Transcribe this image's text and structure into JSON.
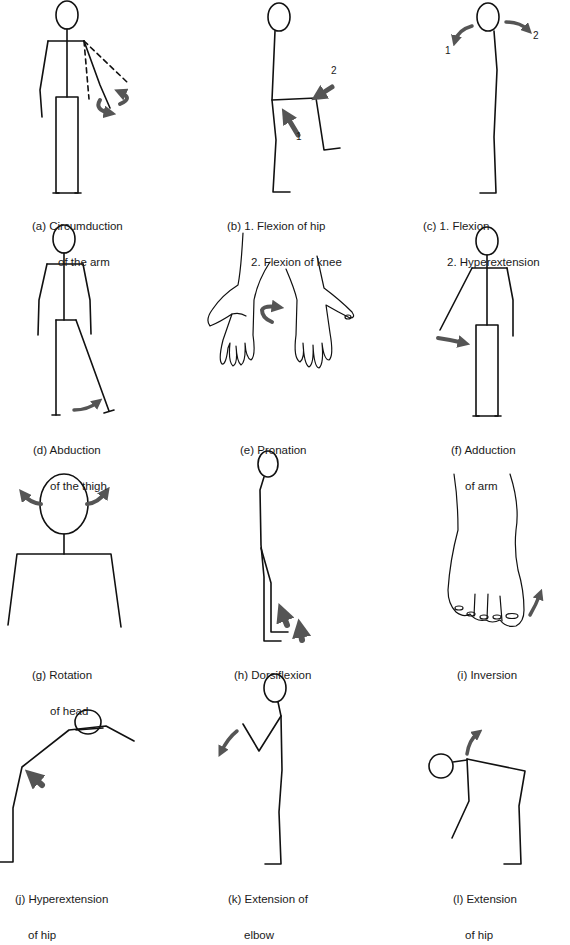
{
  "figure": {
    "stroke_color": "#111111",
    "arrow_color": "#555555",
    "background": "#ffffff"
  },
  "panels": [
    {
      "id": "a",
      "line1": "(a) Circumduction",
      "line2": "of the arm"
    },
    {
      "id": "b",
      "line1": "(b) 1. Flexion of hip",
      "line2": "2. Flexion of knee",
      "markers": [
        "1",
        "2"
      ]
    },
    {
      "id": "c",
      "line1": "(c) 1. Flexion",
      "line2": "2. Hyperextension",
      "markers": [
        "1",
        "2"
      ]
    },
    {
      "id": "d",
      "line1": "(d) Abduction",
      "line2": "of the thigh"
    },
    {
      "id": "e",
      "line1": "(e) Pronation",
      "line2": ""
    },
    {
      "id": "f",
      "line1": "(f) Adduction",
      "line2": "of arm"
    },
    {
      "id": "g",
      "line1": "(g) Rotation",
      "line2": "of head"
    },
    {
      "id": "h",
      "line1": "(h) Dorsiflexion",
      "line2": ""
    },
    {
      "id": "i",
      "line1": "(i) Inversion",
      "line2": ""
    },
    {
      "id": "j",
      "line1": "(j) Hyperextension",
      "line2": "of hip"
    },
    {
      "id": "k",
      "line1": "(k) Extension of",
      "line2": "elbow"
    },
    {
      "id": "l",
      "line1": "(l) Extension",
      "line2": "of hip"
    }
  ]
}
